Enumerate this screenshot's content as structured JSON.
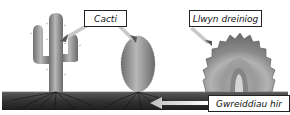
{
  "diagram": {
    "labels": {
      "cacti": "Cacti",
      "llwyn_dreiniog": "Llwyn dreiniog",
      "gwreiddiau_hir": "Gwreiddiau hir"
    },
    "colors": {
      "ground": "#2e2e2e",
      "ground_light": "#555555",
      "cactus_body": "#8a8a8a",
      "cactus_highlight": "#b5b5b5",
      "shrub_outer": "#7a7a7a",
      "shrub_inner": "#b0b0b0",
      "arrow": "#c8c8c8",
      "label_border": "#222222"
    }
  }
}
